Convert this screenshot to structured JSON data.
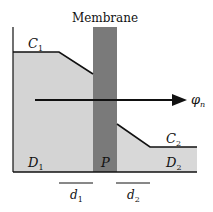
{
  "diagram": {
    "title": "Membrane",
    "labels": {
      "c1": "C",
      "c1_sub": "1",
      "c2": "C",
      "c2_sub": "2",
      "d1_region": "D",
      "d1_region_sub": "1",
      "d2_region": "D",
      "d2_region_sub": "2",
      "membrane_region": "P",
      "flux": "φ",
      "flux_sub": "n",
      "thickness1": "d",
      "thickness1_sub": "1",
      "thickness2": "d",
      "thickness2_sub": "2"
    },
    "colors": {
      "left_fill": "#d4d4d4",
      "right_fill": "#d8d8d8",
      "membrane_fill": "#7a7a7a",
      "stroke": "#111111"
    }
  }
}
